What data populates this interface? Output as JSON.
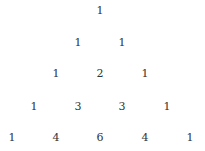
{
  "diagram": {
    "type": "pascal-triangle",
    "rows": [
      [
        "1"
      ],
      [
        "1",
        "1"
      ],
      [
        "1",
        "2",
        "1"
      ],
      [
        "1",
        "3",
        "3",
        "1"
      ],
      [
        "1",
        "4",
        "6",
        "4",
        "1"
      ]
    ]
  }
}
